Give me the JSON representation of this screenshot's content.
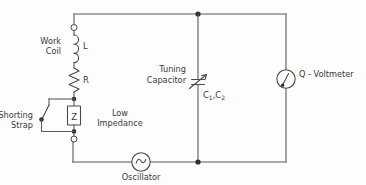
{
  "diagram": {
    "labels": {
      "work_coil": "Work",
      "work_coil_2": "Coil",
      "inductor": "L",
      "resistor": "R",
      "shorting_strap": "Shorting",
      "shorting_strap_2": "Strap",
      "impedance_box": "Z",
      "low_impedance": "Low",
      "low_impedance_2": "Impedance",
      "tuning_capacitor": "Tuning",
      "tuning_capacitor_2": "Capacitor",
      "capacitor_values": "C",
      "capacitor_sub1": "1",
      "capacitor_comma": ",C",
      "capacitor_sub2": "2",
      "q_voltmeter": "Q - Voltmeter",
      "oscillator": "Oscillator"
    },
    "icons": {
      "inductor": "inductor-coil-icon",
      "resistor": "resistor-zigzag-icon",
      "capacitor": "variable-capacitor-icon",
      "switch": "switch-open-icon",
      "meter": "meter-needle-icon",
      "source": "sine-source-icon"
    },
    "colors": {
      "wire": "#5a5a5a",
      "symbol": "#4a4a4a",
      "text": "#3a3a3a",
      "background": "#fdfdfd"
    }
  }
}
